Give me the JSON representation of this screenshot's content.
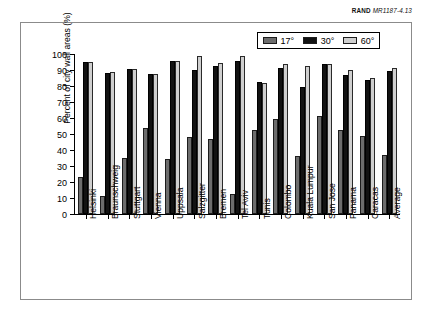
{
  "credit": {
    "organization": "RAND",
    "document_id": "MR1187-4.13"
  },
  "chart_data": {
    "type": "bar",
    "title": "",
    "xlabel": "",
    "ylabel": "Percent of city wall areas (%)",
    "ylim": [
      0,
      100
    ],
    "yticks": [
      0,
      10,
      20,
      30,
      40,
      50,
      60,
      70,
      80,
      90,
      100
    ],
    "grid": false,
    "legend_position": "top-right",
    "categories": [
      "Helsinki",
      "Braunschweig",
      "Stuttgart",
      "Vienna",
      "Uppsala",
      "Salzgitter",
      "Bremen",
      "Tel Aviv",
      "Tunis",
      "Colombo",
      "Kuala Lumpur",
      "San Jose",
      "Panama",
      "Caracas",
      "Average"
    ],
    "series": [
      {
        "name": "17°",
        "color": "#6d6d6d",
        "values": [
          23,
          11.5,
          35,
          54,
          34.5,
          48,
          47,
          12.5,
          52.5,
          59.5,
          36,
          61.5,
          52.5,
          48.5,
          37
        ]
      },
      {
        "name": "30°",
        "color": "#121212",
        "values": [
          95,
          88,
          90.5,
          87.5,
          95.5,
          90,
          92.5,
          95.5,
          82.5,
          91.5,
          79.5,
          94,
          87,
          84,
          89.5
        ]
      },
      {
        "name": "60°",
        "color": "#cfcfcf",
        "values": [
          95,
          89,
          90.5,
          87.5,
          95.5,
          99,
          94.5,
          98.5,
          82,
          93.5,
          92.5,
          94,
          90,
          85,
          91
        ]
      }
    ]
  }
}
